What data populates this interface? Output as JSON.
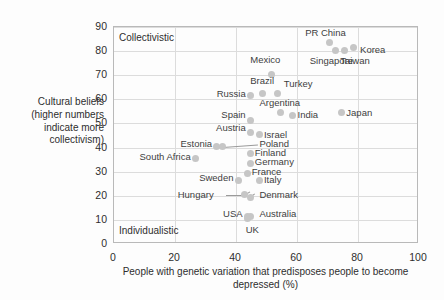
{
  "chart_data": {
    "type": "scatter",
    "title": "",
    "xlabel": "People with genetic variation that predisposes people to become depressed (%)",
    "ylabel": "Cultural beliefs (higher numbers indicate more collectivism)",
    "xlim": [
      0,
      100
    ],
    "ylim": [
      0,
      90
    ],
    "xticks": [
      "0",
      "20",
      "40",
      "60",
      "80",
      "100"
    ],
    "yticks": [
      "0",
      "10",
      "20",
      "30",
      "40",
      "50",
      "60",
      "70",
      "80",
      "90"
    ],
    "grid": true,
    "legend": "none",
    "annotations": [
      {
        "text": "Collectivistic",
        "corner": "top-left"
      },
      {
        "text": "Individualistic",
        "corner": "bottom-left"
      }
    ],
    "points": [
      {
        "label": "PR China",
        "x": 71,
        "y": 83,
        "lx": 63,
        "ly": 87,
        "align": "left"
      },
      {
        "label": "Singapore",
        "x": 73,
        "y": 80,
        "lx": 64.5,
        "ly": 75.5,
        "align": "left"
      },
      {
        "label": "Taiwan",
        "x": 76,
        "y": 80,
        "lx": 74.5,
        "ly": 75.5,
        "align": "left"
      },
      {
        "label": "Korea",
        "x": 79,
        "y": 81,
        "lx": 81,
        "ly": 80,
        "align": "left"
      },
      {
        "label": "Mexico",
        "x": 52,
        "y": 70,
        "lx": 45,
        "ly": 76,
        "align": "left"
      },
      {
        "label": "Brazil",
        "x": 49,
        "y": 62,
        "lx": 45,
        "ly": 67,
        "align": "left"
      },
      {
        "label": "Turkey",
        "x": 54,
        "y": 62,
        "lx": 56,
        "ly": 66,
        "align": "left"
      },
      {
        "label": "Russia",
        "x": 45,
        "y": 61,
        "lx": 43.5,
        "ly": 62,
        "align": "right"
      },
      {
        "label": "Argentina",
        "x": 55,
        "y": 54,
        "lx": 48,
        "ly": 58,
        "align": "left"
      },
      {
        "label": "Spain",
        "x": 45,
        "y": 51,
        "lx": 43.5,
        "ly": 53,
        "align": "right"
      },
      {
        "label": "India",
        "x": 59,
        "y": 53,
        "lx": 60.5,
        "ly": 53,
        "align": "left"
      },
      {
        "label": "Japan",
        "x": 75,
        "y": 54,
        "lx": 76.5,
        "ly": 54,
        "align": "left"
      },
      {
        "label": "Austria",
        "x": 45,
        "y": 46,
        "lx": 43.5,
        "ly": 47.5,
        "align": "right"
      },
      {
        "label": "Israel",
        "x": 48,
        "y": 45,
        "lx": 49.5,
        "ly": 45,
        "align": "left"
      },
      {
        "label": "Estonia",
        "x": 34,
        "y": 40,
        "lx": 32.5,
        "ly": 41,
        "align": "right"
      },
      {
        "label": "Poland",
        "x": 36,
        "y": 40,
        "lx": 48,
        "ly": 41,
        "align": "left"
      },
      {
        "label": "Finland",
        "x": 45,
        "y": 37,
        "lx": 46.5,
        "ly": 37.5,
        "align": "left"
      },
      {
        "label": "Germany",
        "x": 45,
        "y": 33,
        "lx": 46.5,
        "ly": 33.5,
        "align": "left"
      },
      {
        "label": "South Africa",
        "x": 27,
        "y": 35,
        "lx": 25.5,
        "ly": 35.5,
        "align": "right"
      },
      {
        "label": "France",
        "x": 44,
        "y": 29,
        "lx": 45.5,
        "ly": 29.5,
        "align": "left"
      },
      {
        "label": "Italy",
        "x": 48,
        "y": 26,
        "lx": 49.5,
        "ly": 26,
        "align": "left"
      },
      {
        "label": "Sweden",
        "x": 41,
        "y": 26,
        "lx": 39.5,
        "ly": 27,
        "align": "right"
      },
      {
        "label": "Hungary",
        "x": 43,
        "y": 20,
        "lx": 33,
        "ly": 20,
        "align": "right"
      },
      {
        "label": "Denmark",
        "x": 45,
        "y": 19,
        "lx": 48,
        "ly": 20,
        "align": "left"
      },
      {
        "label": "USA",
        "x": 44,
        "y": 11,
        "lx": 42.5,
        "ly": 12,
        "align": "right"
      },
      {
        "label": "Australia",
        "x": 45,
        "y": 11,
        "lx": 48,
        "ly": 12,
        "align": "left"
      },
      {
        "label": "UK",
        "x": 44,
        "y": 10,
        "lx": 43.5,
        "ly": 5.5,
        "align": "left"
      }
    ],
    "leaders": [
      {
        "from": [
          36,
          40
        ],
        "to": [
          47.5,
          41
        ]
      },
      {
        "from": [
          34,
          40
        ],
        "to": [
          36,
          40
        ]
      },
      {
        "from": [
          43,
          20
        ],
        "to": [
          37,
          20
        ]
      },
      {
        "from": [
          43,
          20
        ],
        "to": [
          45,
          21.5
        ]
      },
      {
        "from": [
          45,
          19
        ],
        "to": [
          46.5,
          20.5
        ]
      }
    ],
    "colors": {
      "dot": "#c6c6c6",
      "grid": "#dcdcdc",
      "frame": "#b9b9b9",
      "text": "#2e2e2e",
      "label": "#3d3d3d",
      "background": "#fdfdfd"
    }
  }
}
